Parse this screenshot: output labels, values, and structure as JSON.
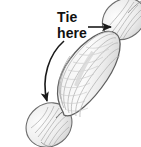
{
  "figure": {
    "background_color": "#ffffff",
    "annotation": {
      "line1": "Tie",
      "line2": "here",
      "text_color": "#111111"
    },
    "arrows": [
      {
        "name": "straight-arrow-to-top-knot",
        "style": "straight",
        "direction": "right",
        "color": "#1a1a1a",
        "from": [
          88,
          27
        ],
        "to": [
          112,
          27
        ]
      },
      {
        "name": "curved-arrow-to-bottom-knot",
        "style": "curved",
        "direction": "down-left",
        "color": "#1a1a1a",
        "from": [
          64,
          41
        ],
        "to": [
          50,
          106
        ]
      }
    ],
    "shapes": {
      "body": {
        "name": "balloon-body",
        "description": "elongated oval bladder oriented lower-left to upper-right",
        "fill_color": "#f2f2f2",
        "stroke_color": "#6e6e6e",
        "rib_color": "#b5b5b5"
      },
      "top_knot": {
        "name": "top-knot",
        "description": "tied knot bulb at upper right end",
        "fill_color": "#efefef",
        "stroke_color": "#6e6e6e"
      },
      "bottom_knot": {
        "name": "bottom-knot",
        "description": "tied knot bulb at lower left end",
        "fill_color": "#efefef",
        "stroke_color": "#6e6e6e"
      }
    }
  }
}
